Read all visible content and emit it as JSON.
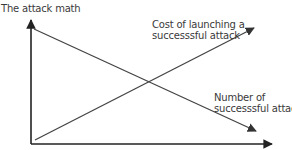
{
  "diagram": {
    "title": "The attack math",
    "series": [
      {
        "name": "cost",
        "label_line1": "Cost of launching a",
        "label_line2": "successsful attack",
        "trend": "increasing"
      },
      {
        "name": "number",
        "label_line1": "Number of",
        "label_line2": "successsful attacks",
        "trend": "decreasing"
      }
    ],
    "colors": {
      "axis": "#222222",
      "line": "#444444",
      "text": "#3a3a3a"
    }
  }
}
